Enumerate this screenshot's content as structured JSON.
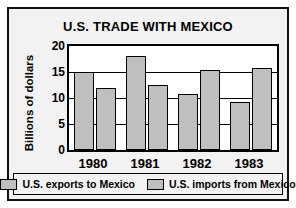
{
  "chart_data": {
    "type": "bar",
    "title": "U.S. TRADE WITH MEXICO",
    "xlabel": "",
    "ylabel": "Billions of dollars",
    "categories": [
      "1980",
      "1981",
      "1982",
      "1983"
    ],
    "series": [
      {
        "name": "U.S. exports to Mexico",
        "values": [
          15.0,
          18.0,
          10.7,
          9.3
        ],
        "color": "#bfbfbf"
      },
      {
        "name": "U.S. imports from Mexico",
        "values": [
          12.0,
          12.5,
          15.3,
          15.8
        ],
        "color": "#bfbfbf"
      }
    ],
    "ylim": [
      0,
      20
    ],
    "yticks": [
      0,
      5,
      10,
      15,
      20
    ],
    "ytick_labels": [
      "0",
      "5",
      "10",
      "15",
      "20"
    ],
    "grid": true,
    "legend_position": "bottom"
  },
  "legend": {
    "entries": [
      {
        "label": "U.S. exports to Mexico"
      },
      {
        "label": "U.S. imports from Mexico"
      }
    ]
  },
  "colors": {
    "bar_fill": "#bfbfbf",
    "outline": "#000000",
    "card_background": "#f2f2f2",
    "plot_background": "#ffffff"
  }
}
